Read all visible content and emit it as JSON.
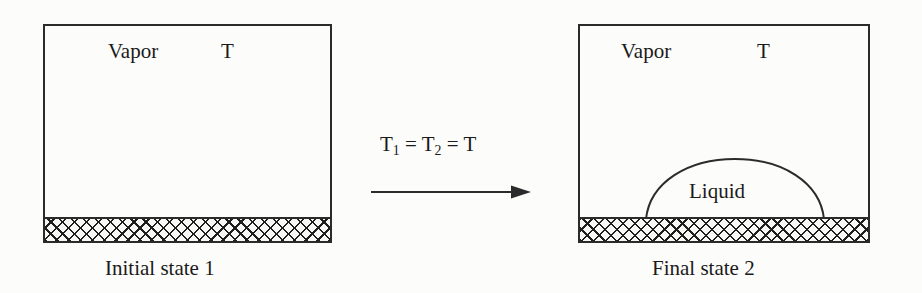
{
  "figure": {
    "type": "thermodynamic-process-diagram",
    "background_color": "#fcfcfb",
    "line_color": "#2b2b2b",
    "text_color": "#1a1a1a"
  },
  "initial_state": {
    "vessel_name": "rigid-container",
    "phase_label": "Vapor",
    "temperature_label": "T",
    "wall_fill": "cross-hatch",
    "caption": "Initial state 1"
  },
  "final_state": {
    "vessel_name": "rigid-container",
    "phase_label": "Vapor",
    "temperature_label": "T",
    "droplet_label": "Liquid",
    "wall_fill": "cross-hatch",
    "caption": "Final state 2"
  },
  "process": {
    "condition_prefix": "T",
    "condition_sub_1": "1",
    "condition_mid": " = T",
    "condition_sub_2": "2",
    "condition_suffix": " = T",
    "arrow_direction": "left-to-right",
    "arrow_name": "process-arrow"
  }
}
